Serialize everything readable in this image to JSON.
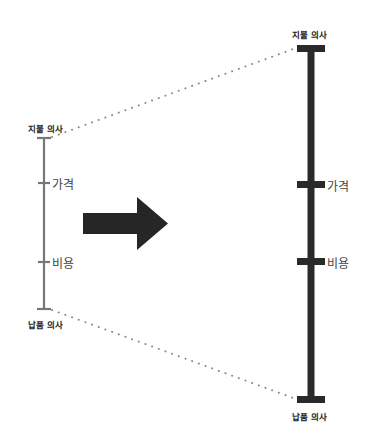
{
  "diagram": {
    "left_scale": {
      "top_label": "지불 의사",
      "bottom_label": "납품 의사",
      "ticks": [
        {
          "label": "가격"
        },
        {
          "label": "비용"
        }
      ],
      "color": "#777777"
    },
    "right_scale": {
      "top_label": "지불 의사",
      "bottom_label": "납품 의사",
      "ticks": [
        {
          "label": "가격"
        },
        {
          "label": "비용"
        }
      ],
      "color": "#2a2a2a"
    },
    "arrow": {
      "direction": "right",
      "color": "#262626"
    },
    "connector_color": "#888888"
  }
}
